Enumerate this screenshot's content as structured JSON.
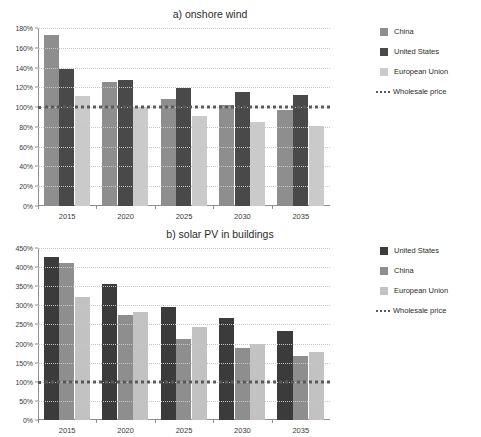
{
  "chart_data": [
    {
      "id": "onshore-wind",
      "type": "bar",
      "title": "a) onshore wind",
      "xlabel": "",
      "ylabel": "",
      "categories": [
        "2015",
        "2020",
        "2025",
        "2030",
        "2035"
      ],
      "yticks": [
        "0%",
        "20%",
        "40%",
        "60%",
        "80%",
        "100%",
        "120%",
        "140%",
        "160%",
        "180%"
      ],
      "ytick_values": [
        0,
        20,
        40,
        60,
        80,
        100,
        120,
        140,
        160,
        180
      ],
      "ylim": [
        0,
        180
      ],
      "grid": true,
      "legend_position": "right",
      "series": [
        {
          "name": "China",
          "color": "#8e8e8e",
          "values": [
            173,
            125,
            108,
            102,
            97
          ]
        },
        {
          "name": "United States",
          "color": "#494949",
          "values": [
            139,
            127,
            119,
            115,
            112
          ]
        },
        {
          "name": "European Union",
          "color": "#cacaca",
          "values": [
            111,
            100,
            91,
            85,
            81
          ]
        }
      ],
      "reference_line": {
        "name": "Wholesale price",
        "value": 100,
        "style": "dotted",
        "color": "#5a5a5a"
      }
    },
    {
      "id": "solar-pv-buildings",
      "type": "bar",
      "title": "b) solar PV in buildings",
      "xlabel": "",
      "ylabel": "",
      "categories": [
        "2015",
        "2020",
        "2025",
        "2030",
        "2035"
      ],
      "yticks": [
        "0%",
        "50%",
        "100%",
        "150%",
        "200%",
        "250%",
        "300%",
        "350%",
        "400%",
        "450%"
      ],
      "ytick_values": [
        0,
        50,
        100,
        150,
        200,
        250,
        300,
        350,
        400,
        450
      ],
      "ylim": [
        0,
        450
      ],
      "grid": true,
      "legend_position": "right",
      "series": [
        {
          "name": "United States",
          "color": "#3b3b3b",
          "values": [
            426,
            357,
            296,
            267,
            233
          ]
        },
        {
          "name": "China",
          "color": "#8e8e8e",
          "values": [
            410,
            274,
            212,
            189,
            168
          ]
        },
        {
          "name": "European Union",
          "color": "#c2c2c2",
          "values": [
            322,
            283,
            244,
            198,
            178
          ]
        }
      ],
      "reference_line": {
        "name": "Wholesale price",
        "value": 100,
        "style": "dotted",
        "color": "#5a5a5a"
      }
    }
  ]
}
